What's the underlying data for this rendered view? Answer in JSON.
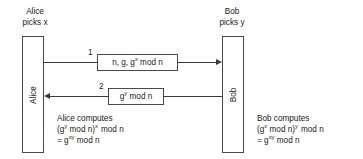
{
  "diagram": {
    "alice": {
      "caption_line1": "Alice",
      "caption_line2": "picks x",
      "box_label": "Alice",
      "compute_line1": "Alice computes",
      "compute_line2_prefix": "(g",
      "compute_line2_sup1": "y",
      "compute_line2_mid": " mod n)",
      "compute_line2_sup2": "x",
      "compute_line2_suffix": "mod n",
      "compute_line3_prefix": "= g",
      "compute_line3_sup": "xy",
      "compute_line3_suffix": " mod n"
    },
    "bob": {
      "caption_line1": "Bob",
      "caption_line2": "picks y",
      "box_label": "Bob",
      "compute_line1": "Bob computes",
      "compute_line2_prefix": "(g",
      "compute_line2_sup1": "x",
      "compute_line2_mid": " mod n)",
      "compute_line2_sup2": "y",
      "compute_line2_suffix": "mod n",
      "compute_line3_prefix": "= g",
      "compute_line3_sup": "xy",
      "compute_line3_suffix": " mod n"
    },
    "messages": [
      {
        "number": "1",
        "text_prefix": "n, g, g",
        "text_sup": "x",
        "text_suffix": " mod n",
        "direction": "alice-to-bob"
      },
      {
        "number": "2",
        "text_prefix": "g",
        "text_sup": "y",
        "text_suffix": " mod n",
        "direction": "bob-to-alice"
      }
    ],
    "colors": {
      "stroke": "#4a4a4a",
      "text": "#1a1a1a",
      "background": "#ffffff"
    }
  }
}
